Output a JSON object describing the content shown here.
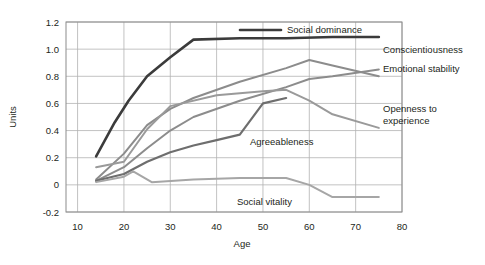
{
  "chart_data": {
    "type": "line",
    "title": "",
    "xlabel": "Age",
    "ylabel": "Units",
    "xlim": [
      7.5,
      80
    ],
    "ylim": [
      -0.2,
      1.2
    ],
    "xticks": [
      10,
      20,
      30,
      40,
      50,
      60,
      70,
      80
    ],
    "yticks": [
      -0.2,
      0,
      0.2,
      0.4,
      0.6,
      0.8,
      1.0,
      1.2
    ],
    "xtick_labels": [
      "10",
      "20",
      "30",
      "40",
      "50",
      "60",
      "70",
      "80"
    ],
    "ytick_labels": [
      "-0.2",
      "0",
      "0.2",
      "0.4",
      "0.6",
      "0.8",
      "1.0",
      "1.2"
    ],
    "grid": true,
    "legend_position": "inline-right",
    "series": [
      {
        "name": "Social dominance",
        "color": "#3b3b3b",
        "width": 2.6,
        "x": [
          14,
          18,
          21,
          25,
          30,
          35,
          45,
          55,
          65,
          75
        ],
        "y": [
          0.21,
          0.46,
          0.62,
          0.8,
          0.94,
          1.07,
          1.08,
          1.08,
          1.09,
          1.09
        ]
      },
      {
        "name": "Conscientiousness",
        "color": "#8c8c8c",
        "width": 2.0,
        "x": [
          14,
          20,
          25,
          30,
          35,
          45,
          55,
          60,
          65,
          75
        ],
        "y": [
          0.03,
          0.13,
          0.27,
          0.4,
          0.5,
          0.62,
          0.72,
          0.78,
          0.8,
          0.85
        ]
      },
      {
        "name": "Emotional stability",
        "color": "#8c8c8c",
        "width": 2.0,
        "x": [
          14,
          20,
          25,
          30,
          35,
          45,
          55,
          60,
          65,
          75
        ],
        "y": [
          0.04,
          0.23,
          0.44,
          0.56,
          0.64,
          0.76,
          0.86,
          0.92,
          0.88,
          0.8
        ]
      },
      {
        "name": "Openness to experience",
        "color": "#9a9a9a",
        "width": 2.0,
        "x": [
          14,
          20,
          25,
          30,
          40,
          50,
          55,
          60,
          65,
          75
        ],
        "y": [
          0.13,
          0.17,
          0.41,
          0.58,
          0.66,
          0.69,
          0.7,
          0.62,
          0.52,
          0.42
        ]
      },
      {
        "name": "Agreeableness",
        "color": "#6e6e6e",
        "width": 2.2,
        "x": [
          14,
          20,
          25,
          30,
          35,
          40,
          45,
          50,
          55
        ],
        "y": [
          0.03,
          0.08,
          0.17,
          0.24,
          0.29,
          0.33,
          0.37,
          0.6,
          0.64
        ]
      },
      {
        "name": "Social vitality",
        "color": "#a6a6a6",
        "width": 2.0,
        "x": [
          14,
          20,
          22,
          26,
          35,
          45,
          55,
          60,
          65,
          75
        ],
        "y": [
          0.02,
          0.06,
          0.1,
          0.02,
          0.04,
          0.05,
          0.05,
          0.0,
          -0.09,
          -0.09
        ]
      }
    ],
    "annotations": [
      {
        "name": "Social dominance",
        "text": "Social dominance",
        "x_px": 287,
        "y_px": 33,
        "lines": [
          "Social dominance"
        ]
      },
      {
        "name": "Conscientiousness",
        "text": "Conscientiousness",
        "x_px": 383,
        "y_px": 53,
        "lines": [
          "Conscientiousness"
        ]
      },
      {
        "name": "Emotional stability",
        "text": "Emotional stability",
        "x_px": 383,
        "y_px": 72,
        "lines": [
          "Emotional stability"
        ]
      },
      {
        "name": "Openness to experience",
        "text": "Openness to experience",
        "x_px": 383,
        "y_px": 112,
        "lines": [
          "Openness to",
          "experience"
        ]
      },
      {
        "name": "Agreeableness",
        "text": "Agreeableness",
        "x_px": 250,
        "y_px": 145,
        "lines": [
          "Agreeableness"
        ]
      },
      {
        "name": "Social vitality",
        "text": "Social vitality",
        "x_px": 237,
        "y_px": 205,
        "lines": [
          "Social vitality"
        ]
      }
    ],
    "legend_swatch": {
      "name": "Social dominance",
      "x1_px": 240,
      "x2_px": 281,
      "y_px": 30,
      "color": "#3b3b3b"
    }
  },
  "colors": {
    "background": "#ffffff",
    "grid": "#b3b3b3",
    "frame": "#8c8c8c",
    "text": "#231f20"
  }
}
